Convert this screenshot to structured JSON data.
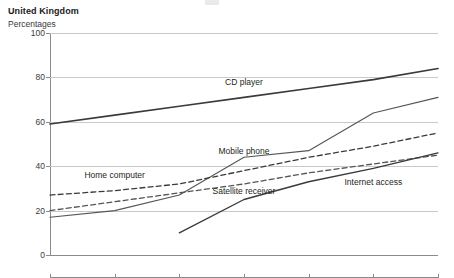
{
  "header": {
    "country": "United Kingdom",
    "units": "Percentages"
  },
  "chart_data": {
    "type": "line",
    "title": "United Kingdom",
    "subtitle": "Percentages",
    "xlabel": "",
    "ylabel": "Percentages",
    "ylim": [
      0,
      100
    ],
    "yticks": [
      0,
      20,
      40,
      60,
      80,
      100
    ],
    "grid": true,
    "legend": "inline-labels",
    "categories": [
      "1996/97",
      "1997/98",
      "1998/99",
      "1999/00",
      "2000/01",
      "2001/02",
      "2002/03"
    ],
    "series": [
      {
        "name": "CD player",
        "style": "solid",
        "width": 1.6,
        "color": "#3a3a3a",
        "values": [
          59,
          63,
          67,
          71,
          75,
          79,
          84
        ],
        "label_x": "1999/00",
        "label_y": 78
      },
      {
        "name": "Mobile phone",
        "style": "solid",
        "width": 1.1,
        "color": "#555555",
        "values": [
          17,
          20,
          27,
          44,
          47,
          64,
          71
        ],
        "label_x": "1999/00",
        "label_y": 47
      },
      {
        "name": "Home computer",
        "style": "dashed",
        "width": 1.3,
        "color": "#3a3a3a",
        "values": [
          27,
          29,
          32,
          38,
          44,
          49,
          55
        ],
        "label_x": "1997/98",
        "label_y": 36
      },
      {
        "name": "Satellite receiver",
        "style": "dashed",
        "width": 1.3,
        "color": "#555555",
        "values": [
          20,
          24,
          28,
          32,
          37,
          41,
          45
        ],
        "label_x": "1999/00",
        "label_y": 29
      },
      {
        "name": "Internet access",
        "style": "solid",
        "width": 1.4,
        "color": "#3a3a3a",
        "values": [
          null,
          null,
          10,
          25,
          33,
          39,
          46
        ],
        "label_x": "2001/02",
        "label_y": 33
      }
    ]
  }
}
